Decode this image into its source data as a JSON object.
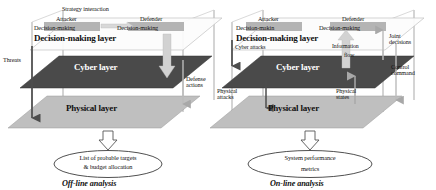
{
  "figure": {
    "type": "layered-architecture-diagram",
    "background": "#ffffff",
    "colors": {
      "decision_plane": "#fdfdfd",
      "decision_plane_edge": "#b9b9b9",
      "cyber_plane": "#4a4a4a",
      "physical_plane": "#bfbfbf",
      "actor_box": "#b5b5b5",
      "arrow_gray": "#a8a8a8",
      "arrow_dark": "#555555",
      "text": "#111111",
      "cyber_text": "#ffffff"
    }
  },
  "panels": [
    {
      "id": "offline",
      "caption": "Off-line analysis",
      "layers": [
        {
          "name": "decision",
          "label": "Decision-making layer"
        },
        {
          "name": "cyber",
          "label": "Cyber layer"
        },
        {
          "name": "physical",
          "label": "Physical layer"
        }
      ],
      "actors": [
        {
          "role": "attacker",
          "title": "Attacker",
          "subtitle": "Decision-making"
        },
        {
          "role": "defender",
          "title": "Defender",
          "subtitle": "Decision-making"
        }
      ],
      "top_annotation": "Strategy interaction",
      "flows": [
        {
          "id": "threats",
          "label": "Threats",
          "direction": "down"
        },
        {
          "id": "defense-actions",
          "label": "Defense\nactions",
          "direction": "down"
        }
      ],
      "outcome": {
        "line1": "List of probable targets",
        "line2": "& budget allocation"
      }
    },
    {
      "id": "online",
      "caption": "On-line analysis",
      "layers": [
        {
          "name": "decision",
          "label": "Decision-making layer"
        },
        {
          "name": "cyber",
          "label": "Cyber layer"
        },
        {
          "name": "physical",
          "label": "Physical layer"
        }
      ],
      "actors": [
        {
          "role": "attacker",
          "title": "Attacker",
          "subtitle": "Decision-makin"
        },
        {
          "role": "defender",
          "title": "Defender",
          "subtitle": "Decision-making"
        }
      ],
      "top_annotation": "",
      "flows": [
        {
          "id": "cyber-attacks",
          "label": "Cyber attacks",
          "direction": "down"
        },
        {
          "id": "information-flow",
          "label": "Information\nflow",
          "direction": "up"
        },
        {
          "id": "joint-decisions",
          "label": "Joint\ndecisions",
          "direction": "up"
        },
        {
          "id": "control-command",
          "label": "Control\ncommand",
          "direction": "down"
        },
        {
          "id": "physical-attacks",
          "label": "Physical\nattacks",
          "direction": "down"
        },
        {
          "id": "physical-states",
          "label": "Physical\nstates",
          "direction": "up"
        }
      ],
      "outcome": {
        "line1": "System performance",
        "line2": "metrics"
      }
    }
  ]
}
